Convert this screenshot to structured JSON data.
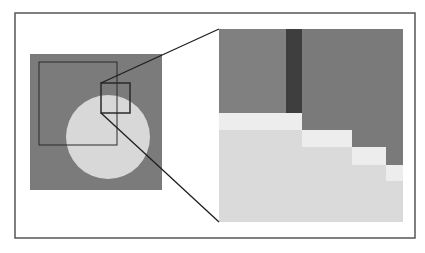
{
  "figure": {
    "title": "",
    "colors": {
      "background": "#ffffff",
      "frame": "#555555",
      "gray_square": "#7b7b7b",
      "circle": "#d8d8d8",
      "outline": "#2a2a2a",
      "zoom_medium_gray": "#808080",
      "zoom_right_gray": "#7a7a7a",
      "zoom_dark_strip": "#3e3e3e",
      "zoom_light_step": "#ededed",
      "zoom_circle_fill": "#dadada",
      "connector": "#1e1e1e"
    },
    "frame": {
      "x": 15,
      "y": 13,
      "w": 400,
      "h": 225
    },
    "source_square": {
      "x": 30,
      "y": 54,
      "w": 132,
      "h": 136
    },
    "inner_rect": {
      "x": 39,
      "y": 62,
      "w": 78,
      "h": 83
    },
    "circle": {
      "cx": 108,
      "cy": 137,
      "r": 42
    },
    "zoom_box": {
      "x": 101,
      "y": 83,
      "w": 29,
      "h": 30
    },
    "zoom_panel": {
      "x": 219,
      "y": 29,
      "w": 184,
      "h": 193
    },
    "dark_strip": {
      "x": 286,
      "y": 29,
      "w": 16,
      "h": 84
    },
    "right_gray_steps": [
      {
        "x": 302,
        "y": 29,
        "w": 101,
        "h": 101
      },
      {
        "x": 352,
        "y": 130,
        "w": 51,
        "h": 17
      },
      {
        "x": 386,
        "y": 147,
        "w": 17,
        "h": 18
      }
    ],
    "light_steps": [
      {
        "x": 219,
        "y": 113,
        "w": 83,
        "h": 17
      },
      {
        "x": 302,
        "y": 130,
        "w": 50,
        "h": 17
      },
      {
        "x": 352,
        "y": 147,
        "w": 34,
        "h": 18
      },
      {
        "x": 386,
        "y": 165,
        "w": 17,
        "h": 16
      }
    ],
    "connectors": [
      {
        "x1": 101,
        "y1": 83,
        "x2": 219,
        "y2": 29
      },
      {
        "x1": 101,
        "y1": 113,
        "x2": 219,
        "y2": 222
      }
    ]
  }
}
